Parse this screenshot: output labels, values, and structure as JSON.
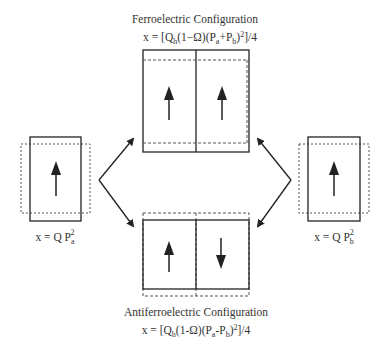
{
  "top": {
    "title": "Ferroelectric Configuration",
    "formula_prefix": "x = [Q",
    "formula_sub_h": "h",
    "formula_mid": "(1−Ω)(P",
    "formula_sub_a": "a",
    "formula_plus": "+P",
    "formula_sub_b": "b",
    "formula_close": ")",
    "formula_sup": "2",
    "formula_end": "]/4",
    "arrows": [
      "up",
      "up"
    ]
  },
  "bottom": {
    "title": "Antiferroelectric Configuration",
    "formula_prefix": "x = [Q",
    "formula_sub_h": "h",
    "formula_mid": "(1-Ω)(P",
    "formula_sub_a": "a",
    "formula_minus": "-P",
    "formula_sub_b": "b",
    "formula_close": ")",
    "formula_sup": "2",
    "formula_end": "]/4",
    "arrows": [
      "up",
      "down"
    ]
  },
  "left": {
    "formula_prefix": "x = Q P",
    "formula_sub": "a",
    "formula_sup": "2",
    "arrow": "up"
  },
  "right": {
    "formula_prefix": "x = Q P",
    "formula_sub": "b",
    "formula_sup": "2",
    "arrow": "up"
  },
  "colors": {
    "line": "#222222",
    "dashed": "#555555",
    "text": "#333333"
  }
}
